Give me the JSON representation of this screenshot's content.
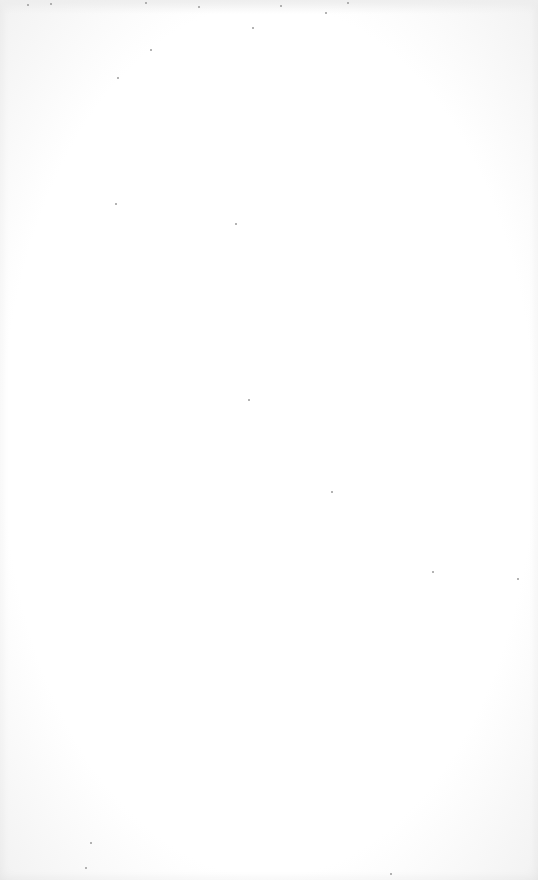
{
  "page": {
    "background": "#ffffff",
    "edge_tint": "#f2f2f2",
    "content": ""
  }
}
